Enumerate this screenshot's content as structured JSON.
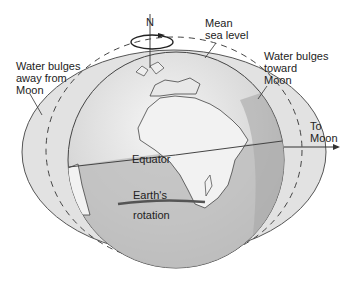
{
  "diagram": {
    "labels": {
      "north": "N",
      "mean_sea_level": "Mean\nsea level",
      "bulge_away": "Water bulges\naway from\nMoon",
      "bulge_toward": "Water bulges\ntoward\nMoon",
      "to_moon": "To\nMoon",
      "equator": "Equator",
      "rotation_top": "Earth's",
      "rotation_bottom": "rotation"
    },
    "colors": {
      "bulge_fill": "#e2e2e2",
      "globe_light": "#f0f0f0",
      "ocean_shade": "#b8b8b8",
      "land": "#f4f4f4",
      "outline": "#444444",
      "rotation_arrow": "#555555"
    }
  }
}
